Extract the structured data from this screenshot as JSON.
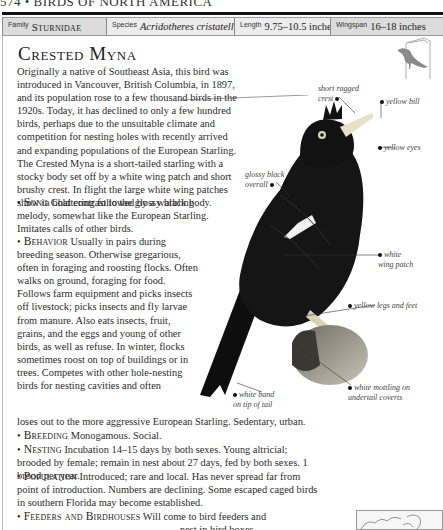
{
  "running_head": "574 • BIRDS OF NORTH AMERICA",
  "info_bar": {
    "family": {
      "label": "Family",
      "value": "Sturnidae"
    },
    "species": {
      "label": "Species",
      "value": "Acridotheres cristatellus"
    },
    "length": {
      "label": "Length",
      "value": "9.75–10.5 inches"
    },
    "wingspan": {
      "label": "Wingspan",
      "value": "16–18 inches"
    }
  },
  "title": "Crested Myna",
  "intro": "Originally a native of Southeast Asia, this bird was introduced in Vancouver, British Columbia, in 1897, and its population rose to a few thousand birds in the 1920s. Today, it has declined to only a few hundred birds, perhaps due to the unsuitable climate and competition for nesting holes with recently arrived and expanding populations of the European Starling. The Crested Myna is a short-tailed starling with a stocky body set off by a white wing patch and short brushy crest. In flight the large white wing patches show in bold contrast to the glossy black body.",
  "sections": {
    "song": {
      "keyword": "Song",
      "text": "Chattering followed by a warbling melody, somewhat like the European Starling. Imitates calls of other birds."
    },
    "behavior": {
      "keyword": "Behavior",
      "text": "Usually in pairs during breeding season. Otherwise gregarious, often in foraging and roosting flocks. Often walks on ground, foraging for food. Follows farm equipment and picks insects off livestock; picks insects and fly larvae from manure. Also eats insects, fruit, grains, and the eggs and young of other birds, as well as refuse. In winter, flocks sometimes roost on top of buildings or in trees. Competes with other hole-nesting birds for nesting cavities and often",
      "text_tail": "loses out to the more aggressive European Starling. Sedentary, urban."
    },
    "breeding": {
      "keyword": "Breeding",
      "text": "Monogamous. Social."
    },
    "nesting": {
      "keyword": "Nesting",
      "text": "Incubation 14–15 days by both sexes. Young altricial; brooded by female; remain in nest about 27 days, fed by both sexes. 1 brood per year."
    },
    "population": {
      "keyword": "Population",
      "text": "Introduced; rare and local. Has never spread far from point of introduction. Numbers are declining. Some escaped caged birds in southern Florida may become established."
    },
    "feeders": {
      "keyword": "Feeders and Birdhouses",
      "text": "Will come to bird feeders and",
      "text_tail": "nest in bird boxes."
    }
  },
  "annotations": {
    "crest": [
      "short ragged",
      "crest"
    ],
    "bill": "yellow bill",
    "eyes": "yellow eyes",
    "glossy": [
      "glossy black",
      "overall"
    ],
    "wing_patch": [
      "white",
      "wing patch"
    ],
    "legs": "yellow legs and feet",
    "tail_band": [
      "white band",
      "on tip of tail"
    ],
    "undertail": [
      "white mottling on",
      "undertail coverts"
    ]
  },
  "colors": {
    "info_dark": "#dcdcdc",
    "info_light": "#ececec",
    "bird_body": "#141414",
    "flight_silhouette": "#8a8a8a"
  }
}
